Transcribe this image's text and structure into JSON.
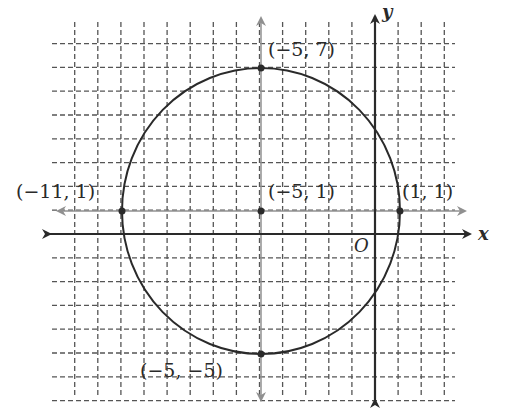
{
  "diagram": {
    "type": "coordinate-plane-circle",
    "circle": {
      "center": [
        -5,
        1
      ],
      "radius": 6
    },
    "axes": {
      "x_label": "x",
      "y_label": "y",
      "origin_label": "O"
    },
    "grid": {
      "x_range": [
        -13,
        3
      ],
      "y_range": [
        -7,
        9
      ],
      "style": "dashed"
    },
    "points": [
      {
        "coords": [
          -5,
          7
        ],
        "label": "(−5, 7)"
      },
      {
        "coords": [
          -11,
          1
        ],
        "label": "(−11, 1)"
      },
      {
        "coords": [
          -5,
          1
        ],
        "label": "(−5, 1)"
      },
      {
        "coords": [
          1,
          1
        ],
        "label": "(1, 1)"
      },
      {
        "coords": [
          -5,
          -5
        ],
        "label": "(−5, −5)"
      }
    ],
    "colors": {
      "ink": "#2a2a2a",
      "grid": "#555555",
      "gray_arrows": "#909090"
    }
  }
}
